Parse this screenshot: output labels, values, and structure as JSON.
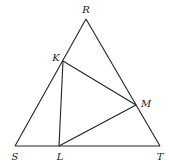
{
  "diagram": {
    "stroke_color": "#222222",
    "background": "#ffffff",
    "points": {
      "R": {
        "label": "R",
        "x": 86,
        "y": 19,
        "lx": 86,
        "ly": 13
      },
      "K": {
        "label": "K",
        "x": 63,
        "y": 61,
        "lx": 56,
        "ly": 61
      },
      "M": {
        "label": "M",
        "x": 136,
        "y": 105,
        "lx": 146,
        "ly": 107
      },
      "S": {
        "label": "S",
        "x": 15,
        "y": 146,
        "lx": 15,
        "ly": 160
      },
      "L": {
        "label": "L",
        "x": 59,
        "y": 146,
        "lx": 60,
        "ly": 160
      },
      "T": {
        "label": "T",
        "x": 160,
        "y": 146,
        "lx": 160,
        "ly": 160
      }
    },
    "segments": [
      {
        "name": "RS",
        "from": "R",
        "to": "S"
      },
      {
        "name": "RT",
        "from": "R",
        "to": "T"
      },
      {
        "name": "ST",
        "from": "S",
        "to": "T"
      },
      {
        "name": "KL",
        "from": "K",
        "to": "L"
      },
      {
        "name": "LM",
        "from": "L",
        "to": "M"
      },
      {
        "name": "KM",
        "from": "K",
        "to": "M"
      }
    ]
  }
}
